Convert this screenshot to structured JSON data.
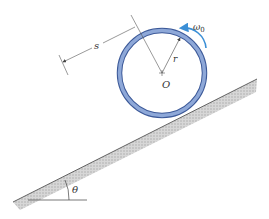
{
  "diagram": {
    "labels": {
      "s": "s",
      "r": "r",
      "center": "O",
      "omega": "ω",
      "omega_sub": "0",
      "theta": "θ"
    },
    "colors": {
      "ring": "#7f9bd0",
      "ring_edge": "#3d5a99",
      "arrow": "#3b8fd6",
      "incline": "#b5b5b5",
      "line": "#444444"
    }
  }
}
